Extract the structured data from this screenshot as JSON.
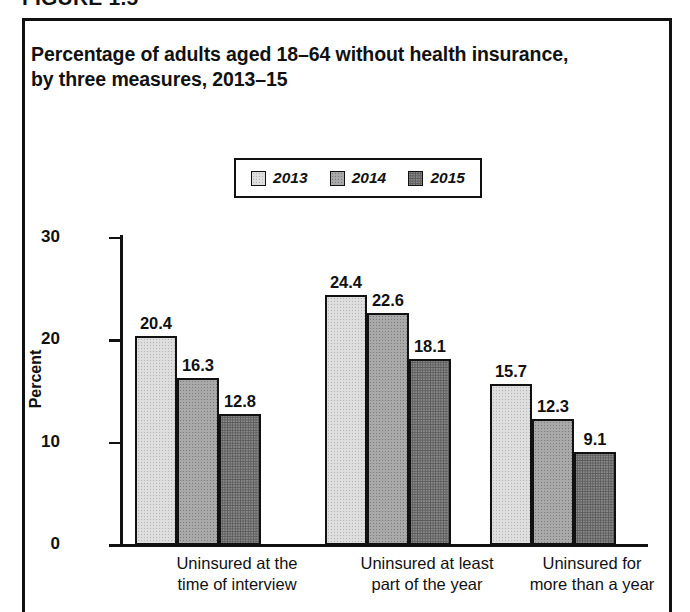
{
  "figure_number": "FIGURE 1.5",
  "title": "Percentage of adults aged 18–64 without health insurance, by three measures, 2013–15",
  "title_line1": "Percentage of adults aged 18–64 without health insurance,",
  "title_line2": "by three measures, 2013–15",
  "colors": {
    "ink": "#111111",
    "series_2013": "#dedede",
    "series_2014": "#a9a9a9",
    "series_2015": "#8a8a8a",
    "background": "#ffffff"
  },
  "legend": {
    "position": "top-center",
    "items": [
      {
        "label": "2013",
        "swatch": "legend-swatch-2013",
        "color": "#dedede"
      },
      {
        "label": "2014",
        "swatch": "legend-swatch-2014",
        "color": "#a9a9a9"
      },
      {
        "label": "2015",
        "swatch": "legend-swatch-2015",
        "color": "#8a8a8a"
      }
    ]
  },
  "axis": {
    "y_title": "Percent",
    "y_ticks": [
      "0",
      "10",
      "20",
      "30"
    ],
    "y_min": 0,
    "y_max": 30
  },
  "categories": [
    {
      "line1": "Uninsured at the",
      "line2": "time of interview"
    },
    {
      "line1": "Uninsured at least",
      "line2": "part of the year"
    },
    {
      "line1": "Uninsured for",
      "line2": "more than a year"
    }
  ],
  "bars": [
    {
      "value": "20.4"
    },
    {
      "value": "16.3"
    },
    {
      "value": "12.8"
    },
    {
      "value": "24.4"
    },
    {
      "value": "22.6"
    },
    {
      "value": "18.1"
    },
    {
      "value": "15.7"
    },
    {
      "value": "12.3"
    },
    {
      "value": "9.1"
    }
  ],
  "chart_data": {
    "type": "bar",
    "title": "Percentage of adults aged 18–64 without health insurance, by three measures, 2013–15",
    "xlabel": "",
    "ylabel": "Percent",
    "ylim": [
      0,
      30
    ],
    "yticks": [
      0,
      10,
      20,
      30
    ],
    "grid": false,
    "legend_position": "top-center",
    "categories": [
      "Uninsured at the time of interview",
      "Uninsured at least part of the year",
      "Uninsured for more than a year"
    ],
    "series": [
      {
        "name": "2013",
        "color": "#dedede",
        "values": [
          20.4,
          24.4,
          15.7
        ]
      },
      {
        "name": "2014",
        "color": "#a9a9a9",
        "values": [
          16.3,
          22.6,
          12.3
        ]
      },
      {
        "name": "2015",
        "color": "#8a8a8a",
        "values": [
          12.8,
          18.1,
          9.1
        ]
      }
    ],
    "data_labels": [
      [
        20.4,
        16.3,
        12.8
      ],
      [
        24.4,
        22.6,
        18.1
      ],
      [
        15.7,
        12.3,
        9.1
      ]
    ]
  }
}
